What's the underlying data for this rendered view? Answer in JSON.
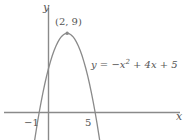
{
  "figure": {
    "background_color": "#ffffff",
    "line_color": "#8a8a8a",
    "text_color": "#555555",
    "width": 188,
    "height": 140
  },
  "axes": {
    "x_axis_label": "x",
    "y_axis_label": "y",
    "x_tick_labels": [
      "−1",
      "5"
    ],
    "x_tick_values": [
      -1,
      5
    ]
  },
  "annotations": {
    "vertex_label": "(2, 9)",
    "equation_lhs": "y = −x",
    "equation_exponent": "2",
    "equation_rhs": " + 4x + 5"
  },
  "chart_data": {
    "type": "line",
    "title": "",
    "xlabel": "x",
    "ylabel": "y",
    "grid": false,
    "legend": null,
    "equation": "y = -x^2 + 4x + 5",
    "xlim": [
      -5.2,
      14.9
    ],
    "ylim": [
      -3.2,
      11.8
    ],
    "x_ticks": [
      -1,
      5
    ],
    "x_tick_labels": [
      "−1",
      "5"
    ],
    "y_ticks": [],
    "y_tick_labels": [],
    "roots": [
      -1,
      5
    ],
    "vertex": [
      2,
      9
    ],
    "vertex_label": "(2, 9)",
    "vertex_marker": true,
    "series": [
      {
        "name": "y = -x^2 + 4x + 5",
        "label": "y = −x² + 4x + 5",
        "color": "#8a8a8a",
        "x": [
          -1.6,
          -1.4,
          -1.2,
          -1.0,
          -0.8,
          -0.6,
          -0.4,
          -0.2,
          0.0,
          0.2,
          0.4,
          0.6,
          0.8,
          1.0,
          1.2,
          1.4,
          1.6,
          1.8,
          2.0,
          2.2,
          2.4,
          2.6,
          2.8,
          3.0,
          3.2,
          3.4,
          3.6,
          3.8,
          4.0,
          4.2,
          4.4,
          4.6,
          4.8,
          5.0,
          5.2,
          5.4,
          5.6
        ],
        "y": [
          -3.96,
          -2.56,
          -1.24,
          0.0,
          1.16,
          2.24,
          3.24,
          4.16,
          5.0,
          5.76,
          6.44,
          7.04,
          7.56,
          8.0,
          8.36,
          8.64,
          8.84,
          8.96,
          9.0,
          8.96,
          8.84,
          8.64,
          8.36,
          8.0,
          7.56,
          7.04,
          6.44,
          5.76,
          5.0,
          4.16,
          3.24,
          2.24,
          1.16,
          0.0,
          -1.24,
          -2.56,
          -3.96
        ]
      }
    ]
  }
}
